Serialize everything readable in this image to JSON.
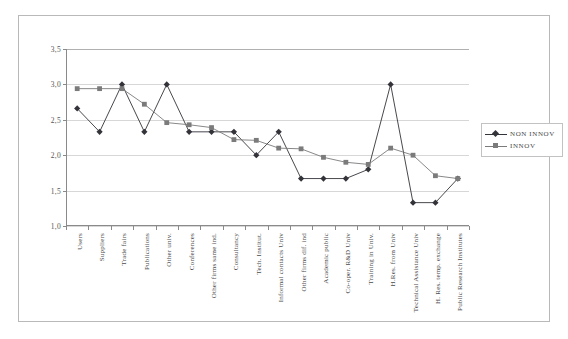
{
  "chart_data": {
    "type": "line",
    "title": "",
    "xlabel": "",
    "ylabel": "",
    "ylim": [
      1.0,
      3.5
    ],
    "ytick_values": [
      3.5,
      3.0,
      2.5,
      2.0,
      1.5,
      1.0
    ],
    "ytick_labels": [
      "3,5",
      "3,0",
      "2,5",
      "2,0",
      "1,5",
      "1,0"
    ],
    "grid": true,
    "grid_axis": "y",
    "legend_position": "right",
    "categories": [
      "Users",
      "Suppliers",
      "Trade fairs",
      "Publications",
      "Other univ.",
      "Conferences",
      "Other firms same ind.",
      "Consultancy",
      "Tech. Institut.",
      "Informal contacts Univ",
      "Other firms dif. ind",
      "Academic public",
      "Co-oper. R&D Univ",
      "Training in Univ.",
      "H.Res. from Univ",
      "Technical Assistance Univ",
      "H. Res. temp. exchange",
      "Public Research Institutes"
    ],
    "series": [
      {
        "name": "NON INNOV",
        "marker": "diamond",
        "color": "#33333a",
        "values": [
          2.66,
          2.33,
          3.0,
          2.33,
          3.0,
          2.33,
          2.33,
          2.33,
          2.0,
          2.33,
          1.67,
          1.67,
          1.67,
          1.8,
          3.0,
          1.33,
          1.33,
          1.67
        ]
      },
      {
        "name": "INNOV",
        "marker": "square",
        "color": "#7b7b7b",
        "values": [
          2.94,
          2.94,
          2.94,
          2.72,
          2.46,
          2.43,
          2.39,
          2.22,
          2.21,
          2.1,
          2.09,
          1.97,
          1.9,
          1.87,
          2.1,
          2.0,
          1.71,
          1.67
        ]
      }
    ],
    "colors": {
      "non_innov": "#33333a",
      "innov": "#7b7b7b",
      "gridline": "#d7d7d7",
      "axis": "#8a8a8a",
      "border": "#b9b9b9",
      "text": "#4a4a4a",
      "background": "#ffffff"
    }
  },
  "legend": {
    "items": [
      {
        "label": "NON INNOV"
      },
      {
        "label": "INNOV"
      }
    ]
  }
}
